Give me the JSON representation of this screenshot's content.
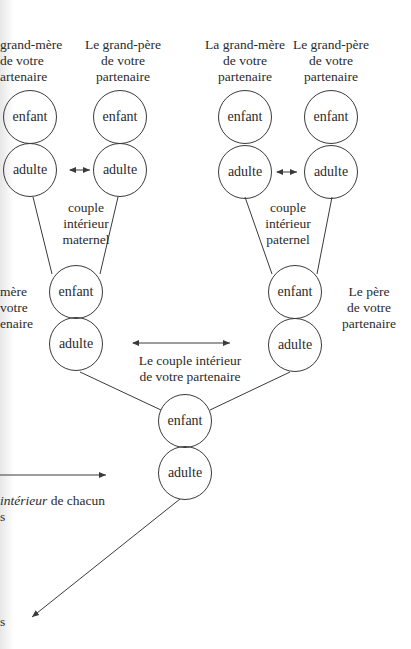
{
  "diagram": {
    "grandparents": {
      "maternal_grandmother": {
        "lines": [
          "grand-mère",
          "de votre",
          "artenaire"
        ]
      },
      "maternal_grandfather": {
        "lines": [
          "Le grand-père",
          "de votre",
          "partenaire"
        ]
      },
      "paternal_grandmother": {
        "lines": [
          "La grand-mère",
          "de votre",
          "partenaire"
        ]
      },
      "paternal_grandfather": {
        "lines": [
          "Le grand-père",
          "de votre",
          "partenaire"
        ]
      }
    },
    "nodes": {
      "child_label": "enfant",
      "adult_label": "adulte"
    },
    "couples": {
      "maternal": {
        "lines": [
          "couple",
          "intérieur",
          "maternel"
        ]
      },
      "paternal": {
        "lines": [
          "couple",
          "intérieur",
          "paternel"
        ]
      },
      "partner": {
        "lines": [
          "Le couple intérieur",
          "de votre partenaire"
        ]
      }
    },
    "parents": {
      "mother": {
        "lines": [
          "mère",
          "votre",
          "enaire"
        ]
      },
      "father": {
        "lines": [
          "Le père",
          "de votre",
          "partenaire"
        ]
      }
    },
    "left_fragments": {
      "interior_line_italic": "intérieur",
      "interior_line_rest": " de chacun",
      "line_s1": "s",
      "line_s2": "s"
    },
    "arrows": [
      {
        "name": "maternal-couple-link",
        "type": "double"
      },
      {
        "name": "paternal-couple-link",
        "type": "double"
      },
      {
        "name": "parents-couple-link",
        "type": "double"
      },
      {
        "name": "left-pointer",
        "type": "single-right"
      },
      {
        "name": "partner-down-left",
        "type": "single-down-left"
      }
    ],
    "colors": {
      "line": "#3a3a3a",
      "text": "#2b2b2b",
      "background": "#ffffff"
    }
  }
}
